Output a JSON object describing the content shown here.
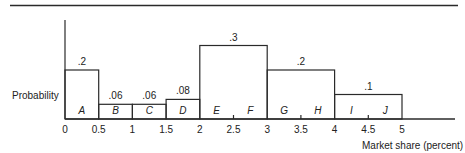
{
  "chart_data": {
    "type": "bar",
    "title": "",
    "xlabel": "Market share (percent)",
    "ylabel": "Probability",
    "x_ticks": [
      "0",
      "0.5",
      "1",
      "1.5",
      "2",
      "2.5",
      "3",
      "3.5",
      "4",
      "4.5",
      "5"
    ],
    "xlim": [
      0,
      5
    ],
    "grid": false,
    "bars": [
      {
        "x_start": 0.0,
        "x_end": 0.5,
        "probability": 0.2,
        "label": ".2",
        "segments": [
          "A"
        ]
      },
      {
        "x_start": 0.5,
        "x_end": 1.0,
        "probability": 0.06,
        "label": ".06",
        "segments": [
          "B"
        ]
      },
      {
        "x_start": 1.0,
        "x_end": 1.5,
        "probability": 0.06,
        "label": ".06",
        "segments": [
          "C"
        ]
      },
      {
        "x_start": 1.5,
        "x_end": 2.0,
        "probability": 0.08,
        "label": ".08",
        "segments": [
          "D"
        ]
      },
      {
        "x_start": 2.0,
        "x_end": 3.0,
        "probability": 0.3,
        "label": ".3",
        "segments": [
          "E",
          "F"
        ]
      },
      {
        "x_start": 3.0,
        "x_end": 4.0,
        "probability": 0.2,
        "label": ".2",
        "segments": [
          "G",
          "H"
        ]
      },
      {
        "x_start": 4.0,
        "x_end": 5.0,
        "probability": 0.1,
        "label": ".1",
        "segments": [
          "I",
          "J"
        ]
      }
    ],
    "categories": [
      "A",
      "B",
      "C",
      "D",
      "E",
      "F",
      "G",
      "H",
      "I",
      "J"
    ]
  },
  "colors": {
    "line": "#2a2a2a",
    "text": "#222222",
    "background": "#ffffff"
  }
}
